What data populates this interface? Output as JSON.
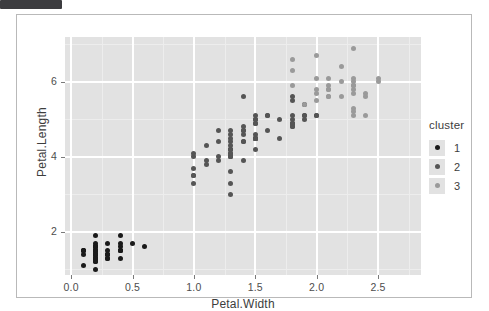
{
  "window": {
    "top_bar_label": ""
  },
  "chart_data": {
    "type": "scatter",
    "title": "",
    "xlabel": "Petal.Width",
    "ylabel": "Petal.Length",
    "xlim": [
      -0.05,
      2.85
    ],
    "ylim": [
      0.85,
      7.2
    ],
    "xticks": [
      "0.0",
      "0.5",
      "1.0",
      "1.5",
      "2.0",
      "2.5"
    ],
    "xtick_values": [
      0.0,
      0.5,
      1.0,
      1.5,
      2.0,
      2.5
    ],
    "yticks": [
      "2",
      "4",
      "6"
    ],
    "ytick_values": [
      2,
      4,
      6
    ],
    "grid": true,
    "panel_background": "#e2e2e2",
    "gridline_color": "#ffffff",
    "legend": {
      "title": "cluster",
      "position": "right",
      "entries": [
        {
          "label": "1",
          "color": "#1a1a1a"
        },
        {
          "label": "2",
          "color": "#555555"
        },
        {
          "label": "3",
          "color": "#9a9a9a"
        }
      ]
    },
    "series": [
      {
        "name": "1",
        "color": "#1a1a1a",
        "points": [
          [
            0.2,
            1.4
          ],
          [
            0.2,
            1.4
          ],
          [
            0.2,
            1.3
          ],
          [
            0.2,
            1.5
          ],
          [
            0.2,
            1.4
          ],
          [
            0.4,
            1.7
          ],
          [
            0.3,
            1.4
          ],
          [
            0.2,
            1.5
          ],
          [
            0.2,
            1.4
          ],
          [
            0.1,
            1.5
          ],
          [
            0.2,
            1.5
          ],
          [
            0.2,
            1.6
          ],
          [
            0.1,
            1.4
          ],
          [
            0.1,
            1.1
          ],
          [
            0.2,
            1.2
          ],
          [
            0.4,
            1.5
          ],
          [
            0.4,
            1.3
          ],
          [
            0.3,
            1.4
          ],
          [
            0.3,
            1.7
          ],
          [
            0.3,
            1.5
          ],
          [
            0.2,
            1.7
          ],
          [
            0.4,
            1.5
          ],
          [
            0.2,
            1.0
          ],
          [
            0.5,
            1.7
          ],
          [
            0.2,
            1.9
          ],
          [
            0.2,
            1.6
          ],
          [
            0.4,
            1.6
          ],
          [
            0.2,
            1.5
          ],
          [
            0.2,
            1.4
          ],
          [
            0.2,
            1.6
          ],
          [
            0.2,
            1.6
          ],
          [
            0.4,
            1.5
          ],
          [
            0.1,
            1.5
          ],
          [
            0.2,
            1.4
          ],
          [
            0.2,
            1.5
          ],
          [
            0.2,
            1.2
          ],
          [
            0.2,
            1.3
          ],
          [
            0.1,
            1.5
          ],
          [
            0.2,
            1.3
          ],
          [
            0.2,
            1.5
          ],
          [
            0.3,
            1.3
          ],
          [
            0.3,
            1.3
          ],
          [
            0.2,
            1.3
          ],
          [
            0.6,
            1.6
          ],
          [
            0.4,
            1.9
          ],
          [
            0.3,
            1.4
          ],
          [
            0.2,
            1.6
          ],
          [
            0.2,
            1.4
          ],
          [
            0.2,
            1.5
          ],
          [
            0.2,
            1.4
          ]
        ]
      },
      {
        "name": "2",
        "color": "#555555",
        "points": [
          [
            1.4,
            4.7
          ],
          [
            1.5,
            4.5
          ],
          [
            1.5,
            4.9
          ],
          [
            1.3,
            4.0
          ],
          [
            1.5,
            4.6
          ],
          [
            1.3,
            4.5
          ],
          [
            1.6,
            4.7
          ],
          [
            1.0,
            3.3
          ],
          [
            1.3,
            4.6
          ],
          [
            1.4,
            3.9
          ],
          [
            1.0,
            3.5
          ],
          [
            1.5,
            4.2
          ],
          [
            1.0,
            4.0
          ],
          [
            1.4,
            4.7
          ],
          [
            1.3,
            3.6
          ],
          [
            1.4,
            4.4
          ],
          [
            1.5,
            4.5
          ],
          [
            1.0,
            4.1
          ],
          [
            1.5,
            4.5
          ],
          [
            1.1,
            3.9
          ],
          [
            1.8,
            4.8
          ],
          [
            1.3,
            4.0
          ],
          [
            1.5,
            4.9
          ],
          [
            1.2,
            4.7
          ],
          [
            1.3,
            4.3
          ],
          [
            1.4,
            4.4
          ],
          [
            1.4,
            4.8
          ],
          [
            1.7,
            5.0
          ],
          [
            1.5,
            4.5
          ],
          [
            1.0,
            3.5
          ],
          [
            1.1,
            3.8
          ],
          [
            1.0,
            3.7
          ],
          [
            1.2,
            3.9
          ],
          [
            1.6,
            5.1
          ],
          [
            1.5,
            4.5
          ],
          [
            1.5,
            4.5
          ],
          [
            1.3,
            4.7
          ],
          [
            1.3,
            4.4
          ],
          [
            1.3,
            4.1
          ],
          [
            1.3,
            4.0
          ],
          [
            1.2,
            4.4
          ],
          [
            1.4,
            4.6
          ],
          [
            1.2,
            4.0
          ],
          [
            1.3,
            3.3
          ],
          [
            1.3,
            4.2
          ],
          [
            1.3,
            4.2
          ],
          [
            1.3,
            4.2
          ],
          [
            1.1,
            4.3
          ],
          [
            1.3,
            3.0
          ],
          [
            1.3,
            4.1
          ],
          [
            1.8,
            4.9
          ],
          [
            1.8,
            5.1
          ],
          [
            1.8,
            5.6
          ],
          [
            1.8,
            4.8
          ],
          [
            1.8,
            4.9
          ],
          [
            2.0,
            5.1
          ],
          [
            1.9,
            5.1
          ],
          [
            1.9,
            5.1
          ],
          [
            1.8,
            5.0
          ],
          [
            1.8,
            5.5
          ],
          [
            2.0,
            5.1
          ],
          [
            1.9,
            5.0
          ],
          [
            1.8,
            4.9
          ],
          [
            1.6,
            5.1
          ],
          [
            1.9,
            5.4
          ],
          [
            1.5,
            5.0
          ],
          [
            1.4,
            5.6
          ],
          [
            1.5,
            5.1
          ],
          [
            1.7,
            4.5
          ],
          [
            1.5,
            5.0
          ]
        ]
      },
      {
        "name": "3",
        "color": "#9a9a9a",
        "points": [
          [
            2.5,
            6.0
          ],
          [
            2.3,
            6.1
          ],
          [
            1.8,
            6.6
          ],
          [
            2.1,
            5.8
          ],
          [
            2.2,
            6.4
          ],
          [
            2.1,
            5.6
          ],
          [
            2.3,
            6.9
          ],
          [
            2.0,
            6.7
          ],
          [
            2.3,
            6.0
          ],
          [
            2.4,
            5.7
          ],
          [
            2.3,
            5.7
          ],
          [
            2.3,
            5.9
          ],
          [
            2.0,
            6.1
          ],
          [
            2.1,
            5.8
          ],
          [
            2.1,
            6.1
          ],
          [
            2.3,
            5.9
          ],
          [
            2.2,
            5.6
          ],
          [
            2.3,
            5.8
          ],
          [
            2.1,
            5.6
          ],
          [
            2.4,
            5.1
          ],
          [
            2.3,
            5.1
          ],
          [
            1.8,
            5.9
          ],
          [
            2.0,
            5.7
          ],
          [
            2.1,
            5.9
          ],
          [
            2.5,
            6.1
          ],
          [
            2.3,
            5.3
          ],
          [
            2.0,
            5.5
          ],
          [
            2.4,
            5.6
          ],
          [
            1.8,
            6.3
          ],
          [
            2.3,
            5.2
          ],
          [
            2.0,
            5.8
          ],
          [
            1.9,
            5.4
          ],
          [
            2.2,
            6.0
          ]
        ]
      }
    ]
  }
}
